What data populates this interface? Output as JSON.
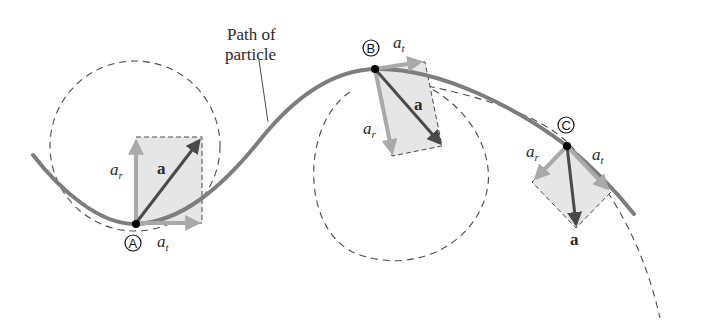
{
  "figure": {
    "title_label_line1": "Path of",
    "title_label_line2": "particle",
    "colors": {
      "background": "#ffffff",
      "path": "#7d7d7d",
      "dashed": "#4a4a4a",
      "box_fill": "#e6e6e6",
      "component_arrow": "#a9a9a9",
      "resultant_arrow": "#4a4a4a",
      "point": "#000000"
    },
    "points": [
      {
        "id": "A",
        "marker": "A",
        "ar_label": "a",
        "ar_sub": "r",
        "at_label": "a",
        "at_sub": "t",
        "a_label": "a"
      },
      {
        "id": "B",
        "marker": "B",
        "ar_label": "a",
        "ar_sub": "r",
        "at_label": "a",
        "at_sub": "t",
        "a_label": "a"
      },
      {
        "id": "C",
        "marker": "C",
        "ar_label": "a",
        "ar_sub": "r",
        "at_label": "a",
        "at_sub": "t",
        "a_label": "a"
      }
    ]
  }
}
